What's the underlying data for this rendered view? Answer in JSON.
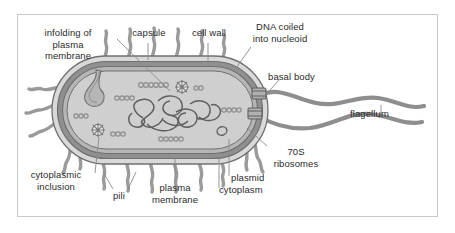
{
  "figure": {
    "kind": "biology-diagram",
    "frame_border_color": "#c9c9c9",
    "background_color": "#ffffff"
  },
  "palette": {
    "outline": "#6f6f6f",
    "capsule_fill": "#d8d8d8",
    "cell_wall_fill": "#8f8f8f",
    "plasma_membrane_fill": "#b5b5b5",
    "cytoplasm_fill": "#cfcfcf",
    "appendage_fill": "#9a9a9a",
    "label_text": "#2b2b2b",
    "leader_line": "#8a8a8a"
  },
  "labels": [
    {
      "id": "infolding-of-plasma-membrane",
      "text": "infolding of\nplasma\nmembrane",
      "align": "center",
      "x": 22,
      "y": 27,
      "width": 92
    },
    {
      "id": "capsule",
      "text": "capsule",
      "align": "center",
      "x": 120,
      "y": 27,
      "width": 58
    },
    {
      "id": "cell-wall",
      "text": "cell wall",
      "align": "center",
      "x": 180,
      "y": 27,
      "width": 58
    },
    {
      "id": "dna-coiled-into-nucleoid",
      "text": "DNA coiled\ninto nucleoid",
      "align": "center",
      "x": 240,
      "y": 21,
      "width": 80
    },
    {
      "id": "basal-body",
      "text": "basal body",
      "align": "left",
      "x": 268,
      "y": 71,
      "width": 68
    },
    {
      "id": "flagellum",
      "text": "flagellum",
      "align": "left",
      "x": 350,
      "y": 108,
      "width": 62
    },
    {
      "id": "70s-ribosomes",
      "text": "70S\nribosomes",
      "align": "center",
      "x": 265,
      "y": 146,
      "width": 62
    },
    {
      "id": "plasmid",
      "text": "plasmid",
      "align": "left",
      "x": 231,
      "y": 172,
      "width": 52
    },
    {
      "id": "cytoplasm",
      "text": "cytoplasm",
      "align": "left",
      "x": 219,
      "y": 184,
      "width": 64
    },
    {
      "id": "plasma-membrane",
      "text": "plasma\nmembrane",
      "align": "center",
      "x": 140,
      "y": 182,
      "width": 70
    },
    {
      "id": "pili",
      "text": "pili",
      "align": "center",
      "x": 107,
      "y": 190,
      "width": 24
    },
    {
      "id": "cytoplasmic-inclusion",
      "text": "cytoplasmic\ninclusion",
      "align": "center",
      "x": 18,
      "y": 169,
      "width": 76
    }
  ],
  "structures": {
    "capsule": "outermost light-gray layer surrounding the cell",
    "cell_wall": "dark gray band beneath the capsule",
    "plasma_membrane": "medium gray band inside the cell wall",
    "cytoplasm": "light gray interior fill",
    "nucleoid": "tangled looped DNA strand in cell center",
    "plasmid": "small closed loop near lower right of cytoplasm",
    "ribosomes": "chains of small circles scattered in cytoplasm",
    "cytoplasmic_inclusions": "two starburst granules in cytoplasm",
    "infolding": "inward fold of the plasma membrane at upper left",
    "pili": "short wavy projections around the cell",
    "flagella": "two long wavy filaments extending right from basal bodies",
    "basal_body": "hub where each flagellum meets the cell envelope"
  }
}
